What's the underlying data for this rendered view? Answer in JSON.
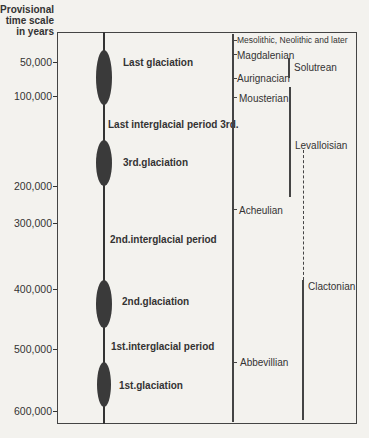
{
  "axis": {
    "title_lines": [
      "Provisional",
      "time scale",
      "in years"
    ],
    "ticks": [
      {
        "label": "50,000",
        "y": 62
      },
      {
        "label": "100,000",
        "y": 96
      },
      {
        "label": "200,000",
        "y": 186
      },
      {
        "label": "300,000",
        "y": 246
      },
      {
        "label": "400,000",
        "y": 286
      },
      {
        "label": "500,000",
        "y": 348
      },
      {
        "label": "600,000",
        "y": 410
      }
    ]
  },
  "periods": [
    {
      "label": "Last glaciation",
      "type": "glaciation"
    },
    {
      "label": "Last interglacial period 3rd.",
      "type": "interglacial"
    },
    {
      "label": "3rd.glaciation",
      "type": "glaciation"
    },
    {
      "label": "2nd.interglacial period",
      "type": "interglacial"
    },
    {
      "label": "2nd.glaciation",
      "type": "glaciation"
    },
    {
      "label": "1st.interglacial period",
      "type": "interglacial"
    },
    {
      "label": "1st.glaciation",
      "type": "glaciation"
    }
  ],
  "cultures": {
    "mesolithic": "Mesolithic, Neolithic and later",
    "magdalenian": "Magdalenian",
    "solutrean": "Solutrean",
    "aurignacian": "Aurignacian",
    "mousterian": "Mousterian",
    "levalloisian": "Levalloisian",
    "acheulian": "Acheulian",
    "clactonian": "Clactonian",
    "abbevillian": "Abbevillian"
  }
}
